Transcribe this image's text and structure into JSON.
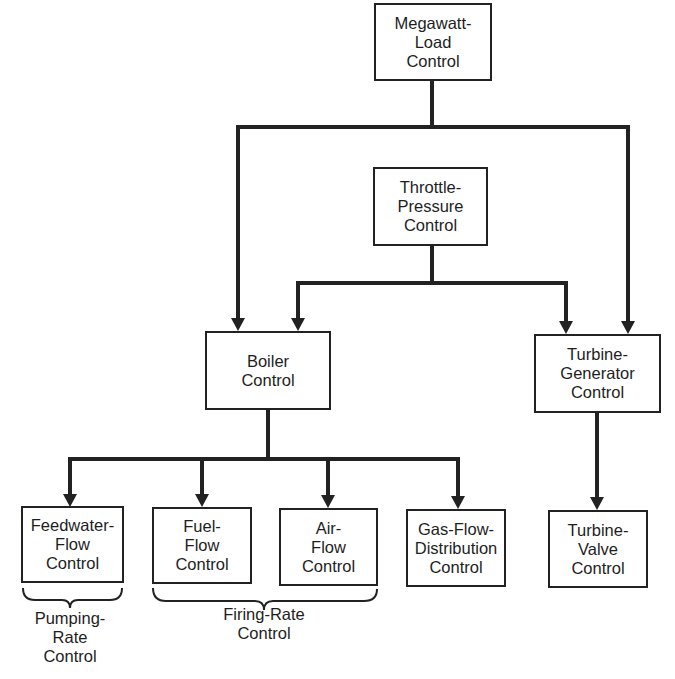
{
  "diagram": {
    "colors": {
      "line": "#222222",
      "text": "#1e1e1e",
      "background": "#ffffff"
    },
    "nodes": {
      "megawatt_load": {
        "lines": [
          "Megawatt-",
          "Load",
          "Control"
        ]
      },
      "throttle_pressure": {
        "lines": [
          "Throttle-",
          "Pressure",
          "Control"
        ]
      },
      "boiler": {
        "lines": [
          "Boiler",
          "Control"
        ]
      },
      "turbine_generator": {
        "lines": [
          "Turbine-",
          "Generator",
          "Control"
        ]
      },
      "feedwater_flow": {
        "lines": [
          "Feedwater-",
          "Flow",
          "Control"
        ]
      },
      "fuel_flow": {
        "lines": [
          "Fuel-",
          "Flow",
          "Control"
        ]
      },
      "air_flow": {
        "lines": [
          "Air-",
          "Flow",
          "Control"
        ]
      },
      "gas_flow_distribution": {
        "lines": [
          "Gas-Flow-",
          "Distribution",
          "Control"
        ]
      },
      "turbine_valve": {
        "lines": [
          "Turbine-",
          "Valve",
          "Control"
        ]
      }
    },
    "groups": {
      "pumping_rate": {
        "lines": [
          "Pumping-",
          "Rate",
          "Control"
        ],
        "members": [
          "feedwater_flow"
        ]
      },
      "firing_rate": {
        "lines": [
          "Firing-Rate",
          "Control"
        ],
        "members": [
          "fuel_flow",
          "air_flow"
        ]
      }
    },
    "edges": [
      {
        "from": "megawatt_load",
        "to": "boiler"
      },
      {
        "from": "megawatt_load",
        "to": "turbine_generator"
      },
      {
        "from": "throttle_pressure",
        "to": "boiler"
      },
      {
        "from": "throttle_pressure",
        "to": "turbine_generator"
      },
      {
        "from": "boiler",
        "to": "feedwater_flow"
      },
      {
        "from": "boiler",
        "to": "fuel_flow"
      },
      {
        "from": "boiler",
        "to": "air_flow"
      },
      {
        "from": "boiler",
        "to": "gas_flow_distribution"
      },
      {
        "from": "turbine_generator",
        "to": "turbine_valve"
      }
    ]
  }
}
